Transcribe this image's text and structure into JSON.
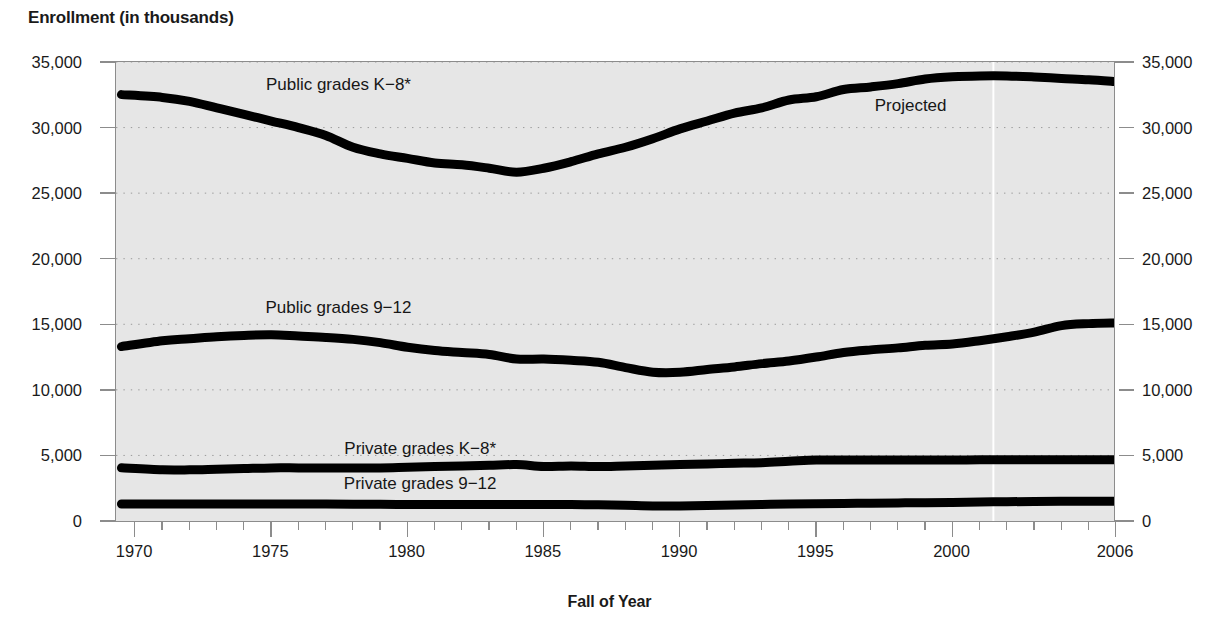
{
  "chart_data": {
    "type": "line",
    "title": "Enrollment (in thousands)",
    "xlabel": "Fall of Year",
    "ylabel": "Enrollment (in thousands)",
    "xlim": [
      1969.3,
      2006
    ],
    "ylim": [
      0,
      35000
    ],
    "grid": "dotted-horizontal",
    "legend_position": "inline-annotations",
    "x_tick_labels": [
      "1970",
      "1975",
      "1980",
      "1985",
      "1990",
      "1995",
      "2000",
      "2006"
    ],
    "x_tick_values": [
      1970,
      1975,
      1980,
      1985,
      1990,
      1995,
      2000,
      2006
    ],
    "y_tick_labels": [
      "0",
      "5,000",
      "10,000",
      "15,000",
      "20,000",
      "25,000",
      "30,000",
      "35,000"
    ],
    "y_tick_values": [
      0,
      5000,
      10000,
      15000,
      20000,
      25000,
      30000,
      35000
    ],
    "annotations": [
      {
        "text": "Public grades K−8*",
        "x": 1977.5,
        "y": 33300
      },
      {
        "text": "Public grades 9−12",
        "x": 1977.5,
        "y": 16300
      },
      {
        "text": "Private grades K−8*",
        "x": 1980.5,
        "y": 5600
      },
      {
        "text": "Private grades 9−12",
        "x": 1980.5,
        "y": 2900
      },
      {
        "text": "Projected",
        "x": 1998.5,
        "y": 31700
      }
    ],
    "projection_marker": {
      "label": "Projected",
      "x": 2001.5,
      "style": "white-vertical-line"
    },
    "x": [
      1969.5,
      1971,
      1972,
      1973,
      1974,
      1975,
      1976,
      1977,
      1978,
      1979,
      1980,
      1981,
      1982,
      1983,
      1984,
      1985,
      1986,
      1987,
      1988,
      1989,
      1990,
      1991,
      1992,
      1993,
      1994,
      1995,
      1996,
      1997,
      1998,
      1999,
      2000,
      2001,
      2002,
      2003,
      2004,
      2005,
      2006
    ],
    "series": [
      {
        "name": "Public grades K−8*",
        "color": "#000000",
        "values": [
          32513,
          32300,
          32000,
          31500,
          31000,
          30500,
          30000,
          29400,
          28500,
          28000,
          27650,
          27300,
          27160,
          26900,
          26600,
          26900,
          27400,
          28000,
          28500,
          29150,
          29900,
          30500,
          31100,
          31500,
          32100,
          32350,
          32900,
          33100,
          33350,
          33700,
          33870,
          33940,
          33940,
          33860,
          33750,
          33650,
          33500
        ]
      },
      {
        "name": "Public grades 9−12",
        "color": "#000000",
        "values": [
          13300,
          13750,
          13900,
          14050,
          14150,
          14200,
          14100,
          14000,
          13850,
          13600,
          13250,
          13000,
          12850,
          12700,
          12350,
          12350,
          12250,
          12100,
          11700,
          11350,
          11340,
          11550,
          11750,
          12000,
          12200,
          12500,
          12850,
          13050,
          13200,
          13400,
          13500,
          13750,
          14050,
          14400,
          14900,
          15050,
          15100
        ]
      },
      {
        "name": "Private grades K−8*",
        "color": "#000000",
        "values": [
          4052,
          3900,
          3900,
          3950,
          4000,
          4050,
          4050,
          4050,
          4050,
          4050,
          4100,
          4150,
          4200,
          4250,
          4300,
          4150,
          4200,
          4150,
          4200,
          4250,
          4300,
          4350,
          4400,
          4450,
          4550,
          4650,
          4650,
          4650,
          4650,
          4650,
          4650,
          4670,
          4680,
          4680,
          4680,
          4680,
          4680
        ]
      },
      {
        "name": "Private grades 9−12",
        "color": "#000000",
        "values": [
          1300,
          1300,
          1300,
          1300,
          1300,
          1300,
          1300,
          1290,
          1280,
          1270,
          1260,
          1250,
          1250,
          1250,
          1250,
          1250,
          1250,
          1240,
          1200,
          1150,
          1150,
          1180,
          1220,
          1260,
          1300,
          1320,
          1340,
          1360,
          1380,
          1400,
          1420,
          1450,
          1470,
          1490,
          1500,
          1500,
          1500
        ]
      }
    ]
  },
  "title": "Enrollment (in thousands)",
  "xaxis_title": "Fall of Year",
  "footnote": ""
}
